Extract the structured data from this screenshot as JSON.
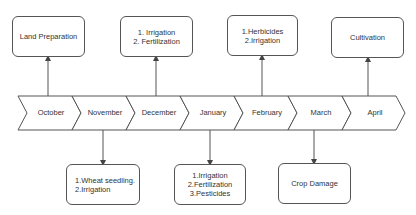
{
  "months": [
    "October",
    "November",
    "December",
    "January",
    "February",
    "March",
    "April"
  ],
  "top_boxes": [
    {
      "month": "October",
      "lines": [
        "Land Preparation"
      ]
    },
    {
      "month": "December",
      "lines": [
        "1. Irrigation",
        "2. Fertilization"
      ]
    },
    {
      "month": "February",
      "lines": [
        "1.Herbicides",
        "2.Irrigation"
      ]
    },
    {
      "month": "April",
      "lines": [
        "Cultivation"
      ]
    }
  ],
  "bottom_boxes": [
    {
      "month": "November",
      "lines": [
        "1.Wheat seedling.",
        "2.Irrigation"
      ]
    },
    {
      "month": "January",
      "lines": [
        "1.Irrigation",
        "2.Fertilization",
        "3.Pesticides"
      ]
    },
    {
      "month": "March",
      "lines": [
        "Crop Damage"
      ]
    }
  ],
  "colors": {
    "stroke": "#555555",
    "text": "#333333",
    "background": "#ffffff"
  }
}
